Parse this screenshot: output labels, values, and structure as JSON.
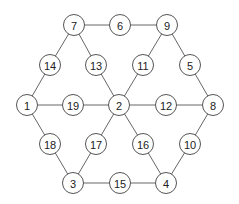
{
  "diagram": {
    "type": "graph",
    "colors": {
      "background": "#ffffff",
      "edge": "#666666",
      "node_stroke": "#555555",
      "node_fill": "#ffffff",
      "label": "#222222"
    },
    "node_radius": 10.5,
    "nodes": [
      {
        "id": "1",
        "label": "1",
        "x": 27,
        "y": 105
      },
      {
        "id": "2",
        "label": "2",
        "x": 119,
        "y": 105
      },
      {
        "id": "3",
        "label": "3",
        "x": 73,
        "y": 183
      },
      {
        "id": "4",
        "label": "4",
        "x": 166,
        "y": 183
      },
      {
        "id": "5",
        "label": "5",
        "x": 190,
        "y": 65
      },
      {
        "id": "6",
        "label": "6",
        "x": 120,
        "y": 25
      },
      {
        "id": "7",
        "label": "7",
        "x": 74,
        "y": 25
      },
      {
        "id": "8",
        "label": "8",
        "x": 213,
        "y": 105
      },
      {
        "id": "9",
        "label": "9",
        "x": 167,
        "y": 25
      },
      {
        "id": "10",
        "label": "10",
        "x": 190,
        "y": 144
      },
      {
        "id": "11",
        "label": "11",
        "x": 143,
        "y": 65
      },
      {
        "id": "12",
        "label": "12",
        "x": 166,
        "y": 105
      },
      {
        "id": "13",
        "label": "13",
        "x": 96,
        "y": 65
      },
      {
        "id": "14",
        "label": "14",
        "x": 50,
        "y": 65
      },
      {
        "id": "15",
        "label": "15",
        "x": 120,
        "y": 183
      },
      {
        "id": "16",
        "label": "16",
        "x": 143,
        "y": 144
      },
      {
        "id": "17",
        "label": "17",
        "x": 96,
        "y": 144
      },
      {
        "id": "18",
        "label": "18",
        "x": 50,
        "y": 144
      },
      {
        "id": "19",
        "label": "19",
        "x": 73,
        "y": 105
      }
    ],
    "edges": [
      [
        "7",
        "6"
      ],
      [
        "6",
        "9"
      ],
      [
        "7",
        "14"
      ],
      [
        "14",
        "1"
      ],
      [
        "7",
        "13"
      ],
      [
        "13",
        "2"
      ],
      [
        "9",
        "11"
      ],
      [
        "11",
        "2"
      ],
      [
        "9",
        "5"
      ],
      [
        "5",
        "8"
      ],
      [
        "1",
        "19"
      ],
      [
        "19",
        "2"
      ],
      [
        "2",
        "12"
      ],
      [
        "12",
        "8"
      ],
      [
        "1",
        "18"
      ],
      [
        "18",
        "3"
      ],
      [
        "2",
        "17"
      ],
      [
        "17",
        "3"
      ],
      [
        "2",
        "16"
      ],
      [
        "16",
        "4"
      ],
      [
        "8",
        "10"
      ],
      [
        "10",
        "4"
      ],
      [
        "3",
        "15"
      ],
      [
        "15",
        "4"
      ]
    ]
  }
}
